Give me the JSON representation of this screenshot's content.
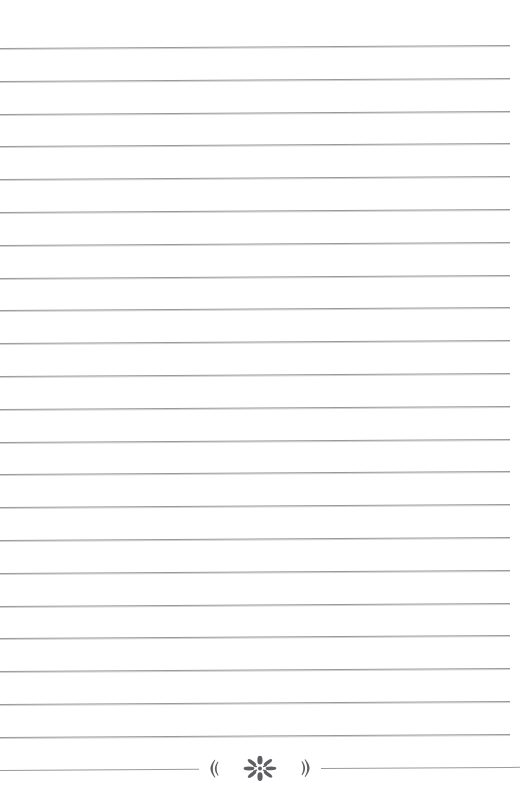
{
  "page": {
    "kind": "lined-stationery-page",
    "background_color": "#ffffff",
    "width": 520,
    "height": 800,
    "title": "Lined Writing Page"
  },
  "ruling": {
    "line_color": "#9a9a9a",
    "line_count": 23,
    "first_line_y": 48,
    "line_spacing": 32.8,
    "line_thickness": 1,
    "left_margin": 0,
    "right_margin": 10,
    "scan_skew_degrees": -0.35
  },
  "ornament": {
    "name": "floral-divider",
    "line_index": 23,
    "y": 770,
    "color": "#5f5f63",
    "center_motif": "eight-petal-rosette",
    "left_bracket": "left-chevron",
    "right_bracket": "right-chevron",
    "petal_count": 8,
    "width": 120
  },
  "content": {
    "written_text": "",
    "placeholder": ""
  }
}
